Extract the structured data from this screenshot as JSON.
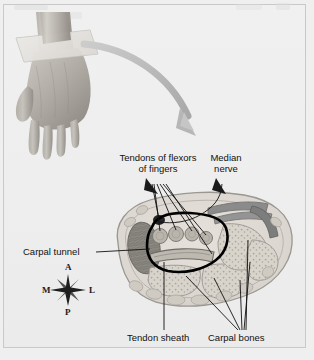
{
  "figure": {
    "title_visible": false,
    "background_color": "#efefef",
    "frame_color": "#c9c9c9"
  },
  "photo": {
    "name": "hand-photograph",
    "description": "grayscale photograph of a left hand palm down with a translucent sectioning plane across the wrist",
    "skin_light": "#c8c4bf",
    "skin_mid": "#a9a49e",
    "skin_dark": "#8c8781",
    "plane_color": "#dcd9d4"
  },
  "arrow": {
    "name": "curved-pointer-arrow",
    "color": "#b9b9b9",
    "description": "large curved arrow sweeping from the wrist plane down to the cross-section"
  },
  "cross_section": {
    "name": "wrist-cross-section",
    "outline_color": "#9a9a96",
    "fill_color": "#dedad3",
    "tendon_color": "#8e8e8e",
    "dark_tendon_color": "#6f6f6f",
    "bone_fill": "#d6d2ca",
    "muscle_fill": "#8a8680",
    "nerve_color": "#2b2b2b",
    "tunnel_outline_color": "#000000"
  },
  "labels": [
    {
      "id": "tendons-of-flexors",
      "line1": "Tendons of flexors",
      "line2": "of fingers"
    },
    {
      "id": "median-nerve",
      "line1": "Median",
      "line2": "nerve"
    },
    {
      "id": "carpal-tunnel",
      "line1": "Carpal tunnel",
      "line2": ""
    },
    {
      "id": "tendon-sheath",
      "line1": "Tendon sheath",
      "line2": ""
    },
    {
      "id": "carpal-bones",
      "line1": "Carpal bones",
      "line2": ""
    }
  ],
  "compass": {
    "name": "orientation-compass",
    "anterior": "A",
    "posterior": "P",
    "medial": "M",
    "lateral": "L"
  }
}
